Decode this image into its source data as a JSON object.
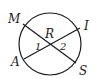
{
  "diagram": {
    "type": "circle-with-intersecting-chords",
    "circle": {
      "cx": 50,
      "cy": 44,
      "r": 31
    },
    "chords": [
      {
        "from": "M",
        "to": "S"
      },
      {
        "from": "A",
        "to": "I"
      }
    ],
    "intersection": "R",
    "points": {
      "M": {
        "label": "M",
        "x": 23,
        "y": 24
      },
      "I": {
        "label": "I",
        "x": 80,
        "y": 28
      },
      "A": {
        "label": "A",
        "x": 24,
        "y": 59
      },
      "S": {
        "label": "S",
        "x": 76,
        "y": 63
      },
      "R": {
        "label": "R",
        "x": 50,
        "y": 44
      }
    },
    "angles": [
      {
        "label": "1",
        "x": 36,
        "y": 52
      },
      {
        "label": "2",
        "x": 61,
        "y": 52
      }
    ],
    "stroke_color": "#1a1a1a"
  }
}
